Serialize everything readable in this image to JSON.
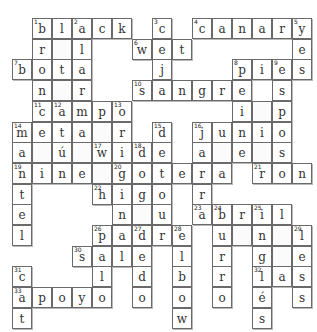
{
  "puzzle": {
    "type": "crossword",
    "cell_width": 20,
    "cell_height": 20.7,
    "origin_x": 12,
    "origin_y": 18,
    "rows": [
      ".black.c.canary",
      ".r_l..wet.....e",
      "bota...j...pies",
      ".n_r..sangre.s.",
      ".campo.....i_p.",
      "meta_r.d.junio.",
      "a_ú_wide.a_e_s.",
      "nine_gotera.ron",
      "t...higo.r.....",
      "e....n_u.abril.",
      "l...padre.u_n_l",
      "...sale.l.r.g_e",
      "c...l.d.b.r.las",
      "apoyo.o.o.o.é.s",
      "t.......w...s.."
    ],
    "numbers": [
      {
        "n": "1",
        "r": 0,
        "c": 1
      },
      {
        "n": "2",
        "r": 0,
        "c": 3
      },
      {
        "n": "3",
        "r": 0,
        "c": 7
      },
      {
        "n": "4",
        "r": 0,
        "c": 9
      },
      {
        "n": "5",
        "r": 0,
        "c": 14
      },
      {
        "n": "6",
        "r": 1,
        "c": 6
      },
      {
        "n": "7",
        "r": 2,
        "c": 0
      },
      {
        "n": "8",
        "r": 2,
        "c": 11
      },
      {
        "n": "9",
        "r": 2,
        "c": 13
      },
      {
        "n": "10",
        "r": 3,
        "c": 6
      },
      {
        "n": "11",
        "r": 4,
        "c": 1
      },
      {
        "n": "12",
        "r": 4,
        "c": 2
      },
      {
        "n": "13",
        "r": 4,
        "c": 5
      },
      {
        "n": "14",
        "r": 5,
        "c": 0
      },
      {
        "n": "15",
        "r": 5,
        "c": 7
      },
      {
        "n": "16",
        "r": 5,
        "c": 9
      },
      {
        "n": "17",
        "r": 6,
        "c": 4
      },
      {
        "n": "18",
        "r": 6,
        "c": 6
      },
      {
        "n": "19",
        "r": 7,
        "c": 0
      },
      {
        "n": "20",
        "r": 7,
        "c": 5
      },
      {
        "n": "21",
        "r": 7,
        "c": 12
      },
      {
        "n": "22",
        "r": 8,
        "c": 4
      },
      {
        "n": "23",
        "r": 9,
        "c": 9
      },
      {
        "n": "24",
        "r": 9,
        "c": 10
      },
      {
        "n": "25",
        "r": 9,
        "c": 12
      },
      {
        "n": "26",
        "r": 10,
        "c": 4
      },
      {
        "n": "27",
        "r": 10,
        "c": 6
      },
      {
        "n": "28",
        "r": 10,
        "c": 8
      },
      {
        "n": "29",
        "r": 10,
        "c": 14
      },
      {
        "n": "30",
        "r": 11,
        "c": 3
      },
      {
        "n": "31",
        "r": 12,
        "c": 0
      },
      {
        "n": "32",
        "r": 12,
        "c": 12
      },
      {
        "n": "33",
        "r": 13,
        "c": 0
      }
    ],
    "across_words": [
      "black",
      "canary",
      "wet",
      "bota",
      "pies",
      "sangre",
      "campo",
      "meta",
      "junio",
      "wide",
      "nine",
      "gotera",
      "ron",
      "higo",
      "abril",
      "padre",
      "sale",
      "las",
      "apoyo"
    ],
    "colors": {
      "border": "#6a6a6a",
      "shadow": "#b8b8b8",
      "letter": "#333333",
      "background": "#ffffff"
    }
  }
}
